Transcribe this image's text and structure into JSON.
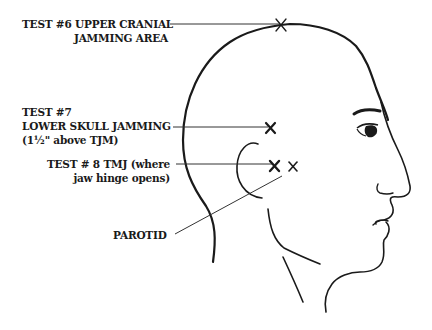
{
  "diagram": {
    "type": "anatomical-head-profile",
    "labels": [
      {
        "id": "test6",
        "lines": [
          "TEST #6 UPPER CRANIAL",
          "JAMMING AREA"
        ]
      },
      {
        "id": "test7",
        "lines": [
          "TEST #7",
          "LOWER SKULL JAMMING",
          "(1½\" above TJM)"
        ]
      },
      {
        "id": "test8",
        "lines": [
          "TEST # 8 TMJ (where",
          "jaw hinge opens)"
        ]
      },
      {
        "id": "parotid",
        "lines": [
          "PAROTID"
        ]
      }
    ],
    "markers": [
      {
        "id": "test6",
        "symbol": "×",
        "x": 281,
        "y": 25
      },
      {
        "id": "test7",
        "symbol": "×",
        "x": 270,
        "y": 128
      },
      {
        "id": "test8",
        "symbol": "×",
        "x": 274,
        "y": 165
      },
      {
        "id": "parotid",
        "symbol": "×",
        "x": 293,
        "y": 166
      }
    ],
    "colors": {
      "ink": "#1a1a1a",
      "background": "#ffffff"
    }
  }
}
